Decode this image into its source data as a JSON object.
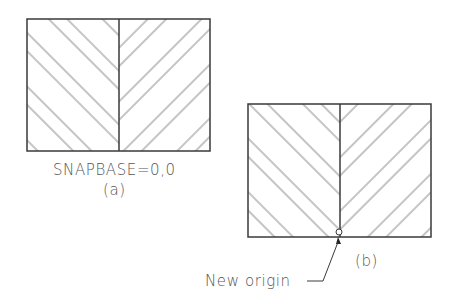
{
  "figure": {
    "panel_a": {
      "snapbase_label": "SNAPBASE=0,0",
      "caption": "(a)"
    },
    "panel_b": {
      "caption": "(b)",
      "origin_callout": "New origin"
    }
  },
  "colors": {
    "outline": "#3a3a3a",
    "hatch": "#8a8a8a",
    "text": "#555555"
  }
}
